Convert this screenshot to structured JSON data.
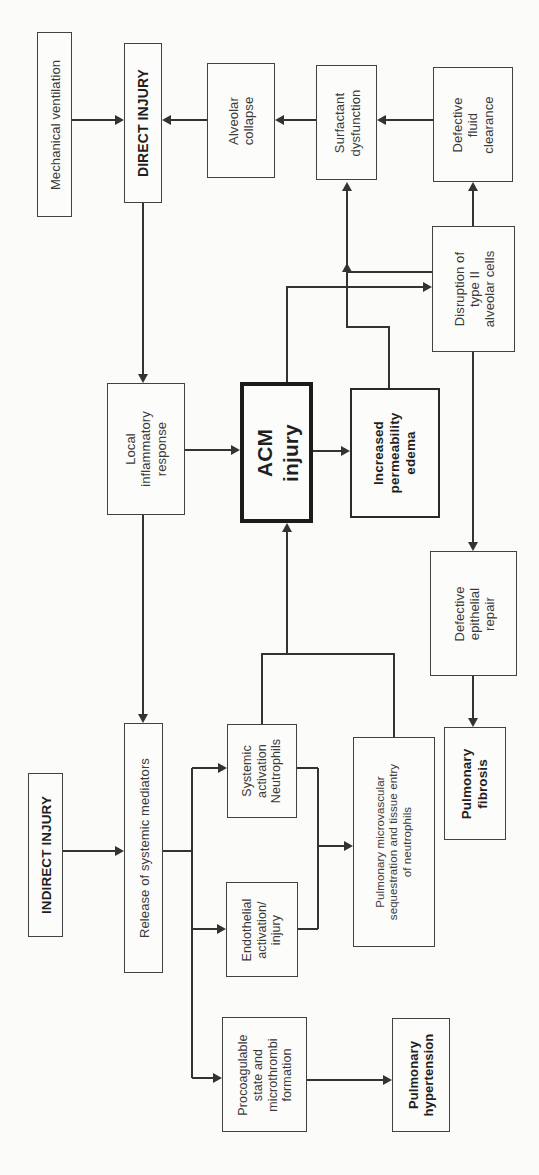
{
  "diagram": {
    "background_color": "#fbfbf9",
    "line_color": "#333333",
    "text_color": "#3a3a3a",
    "nodes": {
      "mechanical_ventilation": {
        "label": "Mechanical ventilation",
        "emphasis": "normal"
      },
      "direct_injury": {
        "label": "DIRECT INJURY",
        "emphasis": "bold"
      },
      "alveolar_collapse": {
        "label": "Alveolar\ncollapse",
        "emphasis": "normal"
      },
      "surfactant_dysfunction": {
        "label": "Surfactant\ndysfunction",
        "emphasis": "normal"
      },
      "defective_fluid_clearance": {
        "label": "Defective\nfluid\nclearance",
        "emphasis": "normal"
      },
      "disruption_type_ii": {
        "label": "Disruption of\ntype II\nalveolar cells",
        "emphasis": "normal"
      },
      "local_inflammatory_response": {
        "label": "Local\ninflammatory\nresponse",
        "emphasis": "normal"
      },
      "acm_injury": {
        "label": "ACM\ninjury",
        "emphasis": "bold-thick-border"
      },
      "increased_permeability_edema": {
        "label": "Increased\npermeability\nedema",
        "emphasis": "bold-medium-border"
      },
      "defective_epithelial_repair": {
        "label": "Defective\nepithelial\nrepair",
        "emphasis": "normal"
      },
      "release_systemic_mediators": {
        "label": "Release of systemic mediators",
        "emphasis": "normal"
      },
      "indirect_injury": {
        "label": "INDIRECT INJURY",
        "emphasis": "bold"
      },
      "systemic_activation_neutrophils": {
        "label": "Systemic\nactivation\nNeutrophils",
        "emphasis": "normal"
      },
      "endothelial_activation_injury": {
        "label": "Endothelial\nactivation/\ninjury",
        "emphasis": "normal"
      },
      "pulmonary_microvascular": {
        "label": "Pulmonary microvascular\nsequestration and tissue entry\nof neutrophils",
        "emphasis": "normal"
      },
      "pulmonary_fibrosis": {
        "label": "Pulmonary\nfibrosis",
        "emphasis": "bold"
      },
      "procoagulable_state": {
        "label": "Procoagulable\nstate and\nmicrothrombi\nformation",
        "emphasis": "normal"
      },
      "pulmonary_hypertension": {
        "label": "Pulmonary\nhypertension",
        "emphasis": "bold"
      }
    },
    "edges": [
      {
        "from": "Mechanical ventilation",
        "to": "DIRECT INJURY"
      },
      {
        "from": "Alveolar collapse",
        "to": "DIRECT INJURY"
      },
      {
        "from": "Surfactant dysfunction",
        "to": "Alveolar collapse"
      },
      {
        "from": "Defective fluid clearance",
        "to": "Surfactant dysfunction"
      },
      {
        "from": "DIRECT INJURY",
        "to": "Local inflammatory response"
      },
      {
        "from": "Local inflammatory response",
        "to": "ACM injury"
      },
      {
        "from": "Local inflammatory response",
        "to": "Release of systemic mediators"
      },
      {
        "from": "ACM injury",
        "to": "Disruption of type II alveolar cells"
      },
      {
        "from": "ACM injury",
        "to": "Increased permeability edema"
      },
      {
        "from": "Increased permeability edema",
        "to": "Surfactant dysfunction"
      },
      {
        "from": "Disruption of type II alveolar cells",
        "to": "Surfactant dysfunction"
      },
      {
        "from": "Disruption of type II alveolar cells",
        "to": "Defective fluid clearance"
      },
      {
        "from": "Disruption of type II alveolar cells",
        "to": "Defective epithelial repair"
      },
      {
        "from": "Defective epithelial repair",
        "to": "Pulmonary fibrosis"
      },
      {
        "from": "INDIRECT INJURY",
        "to": "Release of systemic mediators"
      },
      {
        "from": "Release of systemic mediators",
        "to": "Systemic activation Neutrophils"
      },
      {
        "from": "Release of systemic mediators",
        "to": "Endothelial activation/injury"
      },
      {
        "from": "Release of systemic mediators",
        "to": "Procoagulable state and microthrombi formation"
      },
      {
        "from": "Systemic activation Neutrophils",
        "to": "ACM injury"
      },
      {
        "from": "Pulmonary microvascular sequestration and tissue entry of neutrophils",
        "to": "ACM injury"
      },
      {
        "from": "Systemic activation Neutrophils",
        "to": "Pulmonary microvascular sequestration and tissue entry of neutrophils"
      },
      {
        "from": "Endothelial activation/injury",
        "to": "Pulmonary microvascular sequestration and tissue entry of neutrophils"
      },
      {
        "from": "Procoagulable state and microthrombi formation",
        "to": "Pulmonary hypertension"
      }
    ]
  }
}
